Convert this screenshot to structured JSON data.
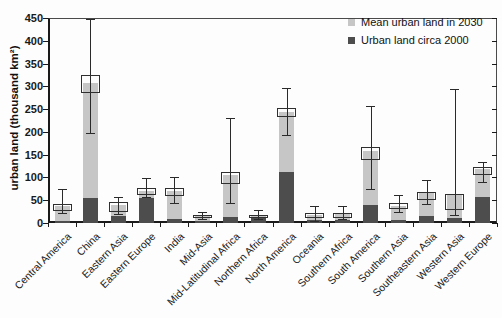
{
  "figure": {
    "y_axis_title": "urban land (thousand km²)",
    "y_ticks": [
      0,
      50,
      100,
      150,
      200,
      250,
      300,
      350,
      400,
      450
    ]
  },
  "legend": {
    "items": [
      {
        "label": "Mean urban land in 2030",
        "color": "#c6c6c6"
      },
      {
        "label": "Urban land circa 2000",
        "color": "#4d4d4d"
      }
    ]
  },
  "colors": {
    "bar_2030": "#c6c6c6",
    "bar_2000": "#4d4d4d",
    "axis": "#1a1a1a",
    "background": "#fdfdfd"
  },
  "chart_data": {
    "type": "bar",
    "stacked": true,
    "title": "",
    "xlabel": "",
    "ylabel": "urban land (thousand km²)",
    "ylim": [
      0,
      450
    ],
    "grid": false,
    "legend_position": "top-right",
    "categories": [
      "Central America",
      "China",
      "Eastern Asia",
      "Eastern Europe",
      "India",
      "Mid-Asia",
      "Mid-Latitudinal Africa",
      "Northern Africa",
      "North America",
      "Oceania",
      "Southern Africa",
      "South America",
      "Southern Asia",
      "Southeastern Asia",
      "Western Asia",
      "Western Europe"
    ],
    "series": [
      {
        "name": "Urban land circa 2000",
        "color": "#4d4d4d",
        "values": [
          5,
          55,
          15,
          54,
          9,
          5,
          13,
          10,
          111,
          6,
          6,
          40,
          7,
          15,
          12,
          56
        ]
      },
      {
        "name": "Mean urban land in 2030",
        "color": "#c6c6c6",
        "values": [
          38,
          308,
          39,
          71,
          71,
          15,
          105,
          15,
          244,
          17,
          20,
          159,
          37,
          65,
          64,
          118
        ]
      }
    ],
    "percentile_boxes": {
      "low": [
        26,
        285,
        25,
        62,
        59,
        12,
        85,
        11,
        233,
        10,
        12,
        138,
        30,
        50,
        29,
        105
      ],
      "high": [
        42,
        325,
        46,
        76,
        76,
        18,
        111,
        17,
        253,
        21,
        22,
        167,
        43,
        69,
        64,
        124
      ]
    },
    "error_bars": {
      "low": [
        21,
        197,
        20,
        58,
        43,
        9,
        43,
        8,
        193,
        5,
        8,
        75,
        25,
        42,
        18,
        91
      ],
      "high": [
        74,
        447,
        57,
        98,
        100,
        24,
        231,
        28,
        296,
        37,
        37,
        257,
        61,
        95,
        295,
        135
      ]
    }
  }
}
